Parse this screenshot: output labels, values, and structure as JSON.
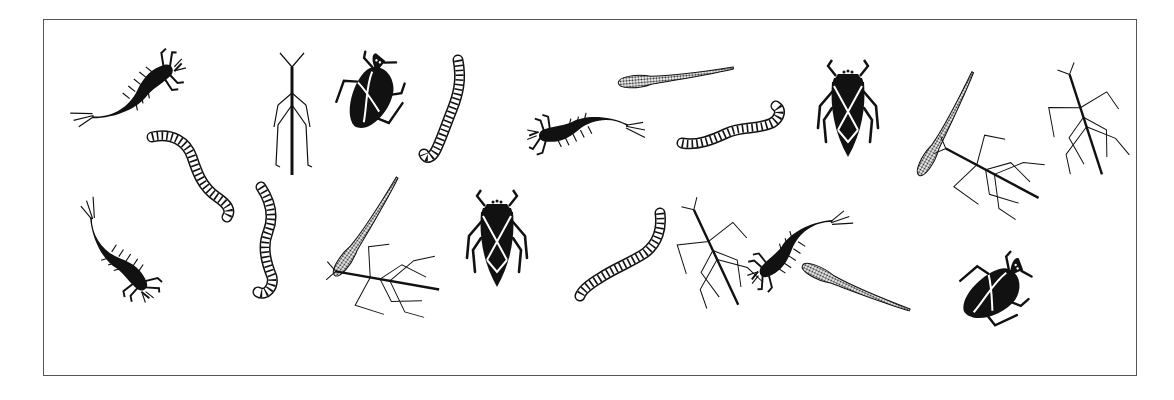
{
  "illustration": {
    "subject": "aquatic insects and larvae",
    "colors": {
      "ink": "#111111",
      "frame": "#555555",
      "background": "#ffffff"
    },
    "figures": [
      {
        "type": "larva",
        "x": 128,
        "y": 95,
        "rotate": -25,
        "scale": 1.0
      },
      {
        "type": "worm",
        "x": 192,
        "y": 172,
        "rotate": 0,
        "scale": 1.0,
        "variant": "a"
      },
      {
        "type": "water-strider",
        "x": 292,
        "y": 115,
        "rotate": 0,
        "scale": 1.0
      },
      {
        "type": "water-bug",
        "x": 370,
        "y": 100,
        "rotate": -60,
        "scale": 1.0
      },
      {
        "type": "worm",
        "x": 446,
        "y": 110,
        "rotate": 0,
        "scale": 1.0,
        "variant": "b"
      },
      {
        "type": "larva",
        "x": 588,
        "y": 130,
        "rotate": 180,
        "scale": 0.95
      },
      {
        "type": "leech",
        "x": 676,
        "y": 78,
        "rotate": -5,
        "scale": 1.0
      },
      {
        "type": "worm",
        "x": 732,
        "y": 128,
        "rotate": 0,
        "scale": 1.0,
        "variant": "c"
      },
      {
        "type": "giant-water-bug",
        "x": 848,
        "y": 112,
        "rotate": 0,
        "scale": 1.0
      },
      {
        "type": "leech",
        "x": 948,
        "y": 125,
        "rotate": -60,
        "scale": 1.0
      },
      {
        "type": "walking-stick",
        "x": 990,
        "y": 172,
        "rotate": -62,
        "scale": 1.0
      },
      {
        "type": "walking-stick",
        "x": 1085,
        "y": 122,
        "rotate": -18,
        "scale": 1.0
      },
      {
        "type": "larva",
        "x": 115,
        "y": 250,
        "rotate": 60,
        "scale": 0.95
      },
      {
        "type": "worm",
        "x": 266,
        "y": 242,
        "rotate": 0,
        "scale": 1.0,
        "variant": "d"
      },
      {
        "type": "leech",
        "x": 368,
        "y": 228,
        "rotate": -55,
        "scale": 1.0
      },
      {
        "type": "walking-stick",
        "x": 385,
        "y": 280,
        "rotate": -80,
        "scale": 1.0
      },
      {
        "type": "giant-water-bug",
        "x": 497,
        "y": 242,
        "rotate": 0,
        "scale": 1.0
      },
      {
        "type": "worm",
        "x": 620,
        "y": 258,
        "rotate": 0,
        "scale": 1.0,
        "variant": "e"
      },
      {
        "type": "walking-stick",
        "x": 715,
        "y": 255,
        "rotate": -25,
        "scale": 1.0
      },
      {
        "type": "larva",
        "x": 800,
        "y": 245,
        "rotate": 150,
        "scale": 0.95
      },
      {
        "type": "leech",
        "x": 855,
        "y": 290,
        "rotate": 25,
        "scale": 1.0
      },
      {
        "type": "water-bug",
        "x": 990,
        "y": 296,
        "rotate": -30,
        "scale": 1.0
      }
    ]
  }
}
